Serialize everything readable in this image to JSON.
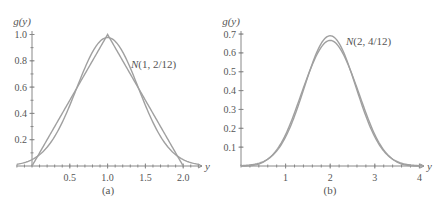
{
  "chart_data": [
    {
      "panel": "(a)",
      "type": "line",
      "ylabel": "g(y)",
      "xlabel": "y",
      "annotation": "N(1, 2/12)",
      "caption": "(a)",
      "xlim": [
        -0.2,
        2.2
      ],
      "ylim": [
        0,
        1.0
      ],
      "x_ticks": [
        0.5,
        1.0,
        1.5,
        2.0
      ],
      "x_tick_labels": [
        "0.5",
        "1.0",
        "1.5",
        "2.0"
      ],
      "y_ticks": [
        0.2,
        0.4,
        0.6,
        0.8,
        1.0
      ],
      "y_tick_labels": [
        "0.2",
        "0.4",
        "0.6",
        "0.8",
        "1.0"
      ],
      "grid": false,
      "series": [
        {
          "name": "Triangular density (sum of 2 uniforms)",
          "x": [
            0,
            1,
            2
          ],
          "values": [
            0,
            1.0,
            0
          ]
        },
        {
          "name": "N(1, 2/12)",
          "mean": 1,
          "variance": 0.1667,
          "x": [
            -0.2,
            0,
            0.25,
            0.5,
            0.75,
            1.0,
            1.25,
            1.5,
            1.75,
            2.0,
            2.2
          ],
          "values": [
            0.012,
            0.049,
            0.182,
            0.46,
            0.812,
            0.977,
            0.812,
            0.46,
            0.182,
            0.049,
            0.012
          ]
        }
      ]
    },
    {
      "panel": "(b)",
      "type": "line",
      "ylabel": "g(y)",
      "xlabel": "y",
      "annotation": "N(2, 4/12)",
      "caption": "(b)",
      "xlim": [
        0,
        4.1
      ],
      "ylim": [
        0,
        0.7
      ],
      "x_ticks": [
        1,
        2,
        3,
        4
      ],
      "x_tick_labels": [
        "1",
        "2",
        "3",
        "4"
      ],
      "y_ticks": [
        0.1,
        0.2,
        0.3,
        0.4,
        0.5,
        0.6,
        0.7
      ],
      "y_tick_labels": [
        "0.1",
        "0.2",
        "0.3",
        "0.4",
        "0.5",
        "0.6",
        "0.7"
      ],
      "grid": false,
      "series": [
        {
          "name": "Density of sum of 4 uniforms",
          "x": [
            0,
            0.5,
            1.0,
            1.5,
            2.0,
            2.5,
            3.0,
            3.5,
            4.0
          ],
          "values": [
            0,
            0.021,
            0.167,
            0.479,
            0.667,
            0.479,
            0.167,
            0.021,
            0
          ]
        },
        {
          "name": "N(2, 4/12)",
          "mean": 2,
          "variance": 0.3333,
          "x": [
            0,
            0.5,
            1.0,
            1.5,
            2.0,
            2.5,
            3.0,
            3.5,
            4.0
          ],
          "values": [
            0.0017,
            0.023,
            0.154,
            0.473,
            0.691,
            0.473,
            0.154,
            0.023,
            0.0017
          ]
        }
      ]
    }
  ]
}
